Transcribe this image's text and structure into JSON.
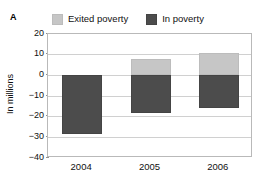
{
  "panel": {
    "letter": "A"
  },
  "chart_data": {
    "type": "bar",
    "title": "",
    "subtitle": "",
    "xlabel": "",
    "ylabel": "In millions",
    "categories": [
      "2004",
      "2005",
      "2006"
    ],
    "series": [
      {
        "name": "Exited poverty",
        "color": "#c6c6c6",
        "values": [
          0,
          8,
          11
        ]
      },
      {
        "name": "In poverty",
        "color": "#4c4c4c",
        "values": [
          -28.5,
          -18,
          -16
        ]
      }
    ],
    "stacked": true,
    "ylim": [
      -40,
      20
    ],
    "yticks": [
      20,
      10,
      0,
      -10,
      -20,
      -30,
      -40
    ],
    "ytick_labels": [
      "20",
      "10",
      "0",
      "−10",
      "−20",
      "−30",
      "−40"
    ],
    "grid": true,
    "grid_axis": "y",
    "legend_position": "top",
    "legend": [
      "Exited poverty",
      "In poverty"
    ],
    "zero_line": 0
  },
  "legend": {
    "entries": [
      {
        "label": "Exited poverty",
        "swatch_name": "legend-swatch-exited-poverty"
      },
      {
        "label": "In poverty",
        "swatch_name": "legend-swatch-in-poverty"
      }
    ]
  },
  "colors": {
    "exited_poverty": "#c6c6c6",
    "in_poverty": "#4c4c4c",
    "gridline": "#d0d0d0",
    "frame": "#b9b9b9",
    "background": "#ffffff",
    "text": "#111111"
  }
}
